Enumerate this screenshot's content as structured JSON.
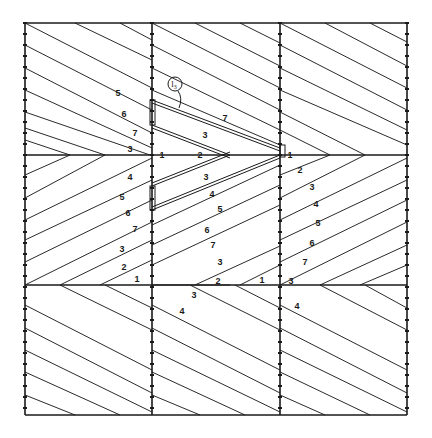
{
  "diagram": {
    "grid": {
      "x": [
        25,
        152,
        280,
        407
      ],
      "y": [
        23,
        155,
        285,
        415
      ],
      "stroke": "#222222"
    },
    "callout": {
      "label": "l",
      "subscript": "3",
      "circle": [
        175,
        84,
        7
      ]
    },
    "bands": [
      {
        "name": "top-band",
        "direction": "down-right",
        "lines": [
          [
            25,
            23,
            152,
            88
          ],
          [
            25,
            45,
            152,
            110
          ],
          [
            25,
            68,
            152,
            133
          ],
          [
            25,
            90,
            152,
            148
          ],
          [
            25,
            112,
            150,
            155
          ],
          [
            25,
            128,
            105,
            155
          ],
          [
            25,
            140,
            70,
            155
          ],
          [
            75,
            23,
            152,
            60
          ],
          [
            120,
            23,
            152,
            40
          ],
          [
            152,
            23,
            280,
            88
          ],
          [
            152,
            45,
            280,
            110
          ],
          [
            152,
            68,
            280,
            130
          ],
          [
            152,
            90,
            280,
            145
          ],
          [
            195,
            23,
            280,
            66
          ],
          [
            240,
            23,
            280,
            43
          ],
          [
            280,
            23,
            407,
            88
          ],
          [
            280,
            45,
            407,
            110
          ],
          [
            280,
            68,
            407,
            130
          ],
          [
            280,
            90,
            407,
            145
          ],
          [
            280,
            112,
            365,
            155
          ],
          [
            280,
            130,
            330,
            155
          ],
          [
            325,
            23,
            407,
            66
          ],
          [
            370,
            23,
            407,
            42
          ]
        ]
      },
      {
        "name": "middle-band",
        "direction": "up-right",
        "lines": [
          [
            25,
            175,
            70,
            155
          ],
          [
            25,
            198,
            105,
            155
          ],
          [
            25,
            220,
            152,
            158
          ],
          [
            25,
            240,
            152,
            180
          ],
          [
            25,
            262,
            152,
            200
          ],
          [
            25,
            285,
            152,
            222
          ],
          [
            60,
            285,
            152,
            240
          ],
          [
            100,
            285,
            152,
            260
          ],
          [
            152,
            285,
            230,
            285
          ],
          [
            195,
            285,
            280,
            246
          ],
          [
            240,
            285,
            280,
            265
          ],
          [
            152,
            225,
            280,
            165
          ],
          [
            152,
            245,
            280,
            185
          ],
          [
            152,
            265,
            280,
            205
          ],
          [
            280,
            175,
            330,
            155
          ],
          [
            280,
            198,
            365,
            155
          ],
          [
            280,
            220,
            407,
            158
          ],
          [
            280,
            240,
            407,
            180
          ],
          [
            280,
            262,
            407,
            200
          ],
          [
            280,
            285,
            407,
            222
          ],
          [
            320,
            285,
            407,
            245
          ],
          [
            360,
            285,
            407,
            265
          ]
        ]
      },
      {
        "name": "bottom-band",
        "direction": "down-right",
        "lines": [
          [
            25,
            305,
            152,
            370
          ],
          [
            25,
            328,
            152,
            393
          ],
          [
            25,
            350,
            152,
            412
          ],
          [
            25,
            372,
            120,
            415
          ],
          [
            25,
            395,
            75,
            415
          ],
          [
            60,
            285,
            152,
            330
          ],
          [
            105,
            285,
            152,
            308
          ],
          [
            152,
            305,
            280,
            370
          ],
          [
            152,
            328,
            280,
            393
          ],
          [
            152,
            350,
            280,
            412
          ],
          [
            152,
            372,
            245,
            415
          ],
          [
            152,
            395,
            200,
            415
          ],
          [
            190,
            285,
            280,
            330
          ],
          [
            235,
            285,
            280,
            308
          ],
          [
            280,
            305,
            407,
            370
          ],
          [
            280,
            328,
            407,
            393
          ],
          [
            280,
            350,
            407,
            412
          ],
          [
            280,
            372,
            370,
            415
          ],
          [
            280,
            395,
            325,
            415
          ],
          [
            320,
            285,
            407,
            330
          ],
          [
            365,
            285,
            407,
            308
          ]
        ]
      }
    ],
    "chevron": {
      "upper_arm": [
        [
          152,
          100
        ],
        [
          280,
          148
        ]
      ],
      "upper_inner": [
        [
          152,
          125
        ],
        [
          230,
          155
        ]
      ],
      "lower_inner": [
        [
          230,
          155
        ],
        [
          152,
          186
        ]
      ],
      "lower_arm": [
        [
          280,
          158
        ],
        [
          152,
          210
        ]
      ],
      "tabs": [
        [
          150,
          100,
          5,
          25
        ],
        [
          150,
          186,
          5,
          24
        ],
        [
          280,
          145,
          5,
          12
        ]
      ]
    },
    "labels": [
      {
        "text": "5",
        "x": 118,
        "y": 96
      },
      {
        "text": "6",
        "x": 124,
        "y": 117
      },
      {
        "text": "7",
        "x": 135,
        "y": 136
      },
      {
        "text": "3",
        "x": 130,
        "y": 152
      },
      {
        "text": "1",
        "x": 162,
        "y": 158
      },
      {
        "text": "2",
        "x": 200,
        "y": 158
      },
      {
        "text": "3",
        "x": 205,
        "y": 138
      },
      {
        "text": "7",
        "x": 225,
        "y": 121
      },
      {
        "text": "3",
        "x": 206,
        "y": 180
      },
      {
        "text": "4",
        "x": 212,
        "y": 197
      },
      {
        "text": "5",
        "x": 220,
        "y": 212
      },
      {
        "text": "6",
        "x": 207,
        "y": 233
      },
      {
        "text": "7",
        "x": 213,
        "y": 248
      },
      {
        "text": "3",
        "x": 220,
        "y": 265
      },
      {
        "text": "2",
        "x": 218,
        "y": 284
      },
      {
        "text": "1",
        "x": 262,
        "y": 283
      },
      {
        "text": "4",
        "x": 130,
        "y": 180
      },
      {
        "text": "5",
        "x": 122,
        "y": 200
      },
      {
        "text": "6",
        "x": 128,
        "y": 216
      },
      {
        "text": "7",
        "x": 135,
        "y": 232
      },
      {
        "text": "3",
        "x": 122,
        "y": 252
      },
      {
        "text": "2",
        "x": 124,
        "y": 270
      },
      {
        "text": "1",
        "x": 137,
        "y": 282
      },
      {
        "text": "1",
        "x": 290,
        "y": 158
      },
      {
        "text": "2",
        "x": 300,
        "y": 173
      },
      {
        "text": "3",
        "x": 312,
        "y": 190
      },
      {
        "text": "4",
        "x": 316,
        "y": 207
      },
      {
        "text": "5",
        "x": 318,
        "y": 226
      },
      {
        "text": "6",
        "x": 312,
        "y": 246
      },
      {
        "text": "7",
        "x": 305,
        "y": 265
      },
      {
        "text": "3",
        "x": 291,
        "y": 284
      },
      {
        "text": "4",
        "x": 297,
        "y": 309
      },
      {
        "text": "3",
        "x": 194,
        "y": 298
      },
      {
        "text": "4",
        "x": 182,
        "y": 314
      }
    ]
  }
}
